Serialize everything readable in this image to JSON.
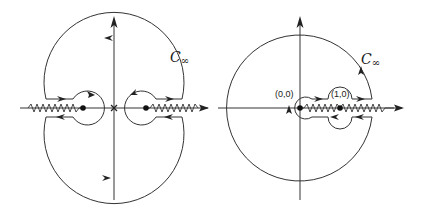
{
  "figure": {
    "left_panel": {
      "contour_label": "C",
      "contour_subscript": "∞",
      "origin_marker": "x",
      "branch_points": 2,
      "description": "Contour around two branch points with cuts extending to ±infinity"
    },
    "right_panel": {
      "contour_label": "C",
      "contour_subscript": "∞",
      "point_labels": [
        "(0,0)",
        "(1,0)"
      ],
      "description": "Contour around branch cut from (0,0) through (1,0) to +infinity"
    },
    "colors": {
      "stroke": "#333333",
      "background": "#ffffff"
    }
  }
}
